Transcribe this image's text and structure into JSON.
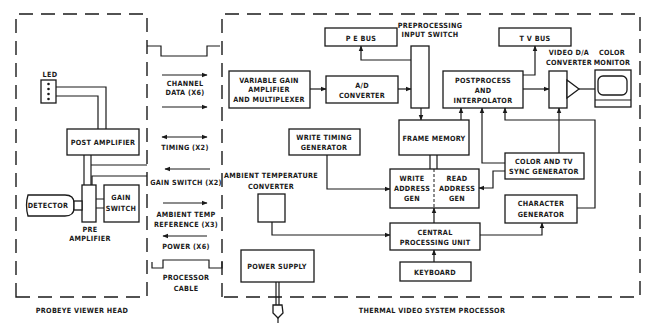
{
  "diagram": {
    "colors": {
      "ink": "#1a1a1a",
      "background": "#ffffff"
    },
    "viewer_head": {
      "title": "PROBEYE VIEWER HEAD",
      "led": "LED",
      "post_amplifier": "POST AMPLIFIER",
      "detector": "DETECTOR",
      "gain_switch": [
        "GAIN",
        "SWITCH"
      ],
      "pre_amplifier": [
        "PRE",
        "AMPLIFIER"
      ]
    },
    "cable": {
      "title": [
        "PROCESSOR",
        "CABLE"
      ],
      "signals": {
        "channel_data": [
          "CHANNEL",
          "DATA (X6)"
        ],
        "timing": "TIMING (X2)",
        "gain_switch": "GAIN SWITCH (X2)",
        "ambient_temp": [
          "AMBIENT TEMP",
          "REFERENCE (X3)"
        ],
        "power": "POWER (X6)"
      }
    },
    "processor": {
      "title": "THERMAL VIDEO SYSTEM PROCESSOR",
      "pe_bus": "P E BUS",
      "preprocessing_switch": [
        "PREPROCESSING",
        "INPUT SWITCH"
      ],
      "tv_bus": "T V BUS",
      "video_da": [
        "VIDEO D/A",
        "CONVERTER"
      ],
      "color_monitor": [
        "COLOR",
        "MONITOR"
      ],
      "vga_mux": [
        "VARIABLE GAIN",
        "AMPLIFIER",
        "AND MULTIPLEXER"
      ],
      "ad_converter": [
        "A/D",
        "CONVERTER"
      ],
      "postprocess": [
        "POSTPROCESS",
        "AND",
        "INTERPOLATOR"
      ],
      "write_timing": [
        "WRITE TIMING",
        "GENERATOR"
      ],
      "frame_memory": "FRAME MEMORY",
      "ambient_converter": [
        "AMBIENT TEMPERATURE",
        "CONVERTER"
      ],
      "write_addr": [
        "WRITE",
        "ADDRESS",
        "GEN"
      ],
      "read_addr": [
        "READ",
        "ADDRESS",
        "GEN"
      ],
      "color_sync": [
        "COLOR AND TV",
        "SYNC GENERATOR"
      ],
      "char_gen": [
        "CHARACTER",
        "GENERATOR"
      ],
      "cpu": [
        "CENTRAL",
        "PROCESSING UNIT"
      ],
      "power_supply": "POWER SUPPLY",
      "keyboard": "KEYBOARD"
    }
  }
}
